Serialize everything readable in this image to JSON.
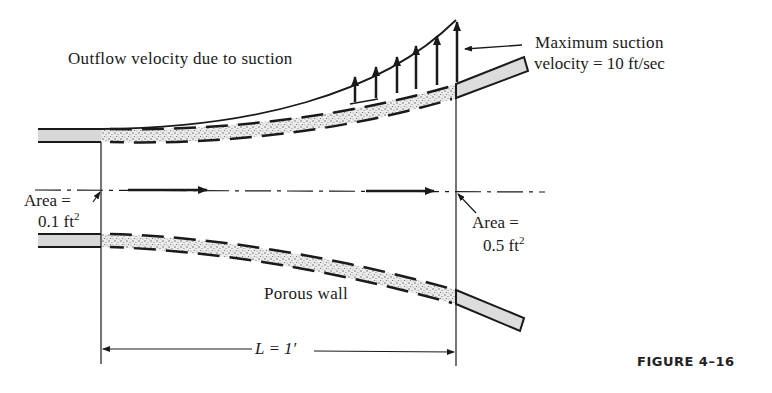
{
  "figure": {
    "caption": "FIGURE 4–16"
  },
  "labels": {
    "outflow": "Outflow velocity due to suction",
    "max_suction_line1": "Maximum suction",
    "max_suction_line2": "velocity = 10 ft/sec",
    "inlet_area_line1": "Area =",
    "inlet_area_value": "0.1 ft",
    "inlet_area_exp": "2",
    "outlet_area_line1": "Area =",
    "outlet_area_value": "0.5 ft",
    "outlet_area_exp": "2",
    "porous_wall": "Porous wall",
    "length": "L = 1′"
  },
  "values": {
    "inlet_area_ft2": 0.1,
    "outlet_area_ft2": 0.5,
    "max_suction_velocity_ft_per_sec": 10,
    "length_ft": 1
  },
  "colors": {
    "ink": "#1a1a1a",
    "pipe_fill": "#dcdcdc",
    "porous_fill": "#bdbdbd"
  }
}
